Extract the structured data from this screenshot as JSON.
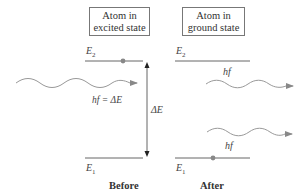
{
  "boxes": {
    "before": {
      "line1": "Atom in",
      "line2": "excited state"
    },
    "after": {
      "line1": "Atom in",
      "line2": "ground state"
    }
  },
  "levels": {
    "upper": {
      "symbol": "E",
      "subscript": "2"
    },
    "lower": {
      "symbol": "E",
      "subscript": "1"
    }
  },
  "labels": {
    "incident_photon": "hf = ΔE",
    "energy_gap": "ΔE",
    "emitted_photon_1": "hf",
    "emitted_photon_2": "hf"
  },
  "captions": {
    "before": "Before",
    "after": "After"
  },
  "colors": {
    "line": "#666666",
    "dot": "#888888",
    "wave": "#999999"
  }
}
